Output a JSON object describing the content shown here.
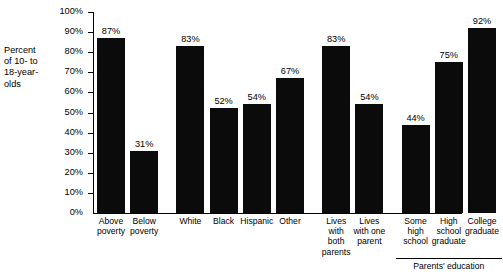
{
  "chart_data": {
    "type": "bar",
    "title": "",
    "xlabel": "",
    "ylabel": "Percent\nof 10- to\n18-year-\nolds",
    "ylim": [
      0,
      100
    ],
    "grid": false,
    "legend": "none",
    "categories": [
      "Above\npoverty",
      "Below\npoverty",
      "White",
      "Black",
      "Hispanic",
      "Other",
      "Lives\nwith\nboth\nparents",
      "Lives\nwith one\nparent",
      "Some\nhigh\nschool",
      "High\nschool\ngraduate",
      "College\ngraduate"
    ],
    "values": [
      87,
      31,
      83,
      52,
      54,
      67,
      83,
      54,
      44,
      75,
      92
    ],
    "value_labels": [
      "87%",
      "31%",
      "83%",
      "52%",
      "54%",
      "67%",
      "83%",
      "54%",
      "44%",
      "75%",
      "92%"
    ],
    "ytick_labels": [
      "100%",
      "90%",
      "80%",
      "70%",
      "60%",
      "50%",
      "40%",
      "30%",
      "20%",
      "10%",
      "0%"
    ],
    "ytick_values": [
      100,
      90,
      80,
      70,
      60,
      50,
      40,
      30,
      20,
      10,
      0
    ],
    "group_annotations": [
      {
        "label": "Parents' education",
        "start_index": 8,
        "end_index": 10
      }
    ],
    "colors": {
      "bar": "#0b0b0b",
      "axis": "#000000",
      "text": "#000000",
      "background": "#ffffff"
    }
  }
}
